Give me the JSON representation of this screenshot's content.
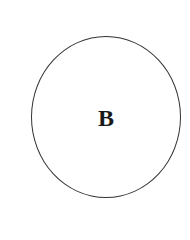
{
  "diagram": {
    "shapes": [
      {
        "type": "circle",
        "label": "B",
        "stroke": "#333333",
        "fill": "#ffffff"
      }
    ]
  }
}
